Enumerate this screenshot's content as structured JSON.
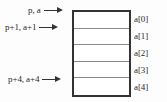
{
  "diagram": {
    "array_box": {
      "name": "array",
      "cell_count": 5,
      "cells": [
        {
          "index_label": "a[0]",
          "value": ""
        },
        {
          "index_label": "a[1]",
          "value": ""
        },
        {
          "index_label": "a[2]",
          "value": ""
        },
        {
          "index_label": "a[3]",
          "value": ""
        },
        {
          "index_label": "a[4]",
          "value": ""
        }
      ]
    },
    "pointers": [
      {
        "id": "p0",
        "label": "p, a",
        "points_to": "a[0]"
      },
      {
        "id": "p1",
        "label": "p+1, a+1",
        "points_to": "a[1]"
      },
      {
        "id": "p4",
        "label": "p+4, a+4",
        "points_to": "a[4]"
      }
    ],
    "colors": {
      "border": "#333333",
      "divider": "#8a8a8a",
      "text": "#2a2a2a",
      "background": "#ffffff"
    }
  }
}
